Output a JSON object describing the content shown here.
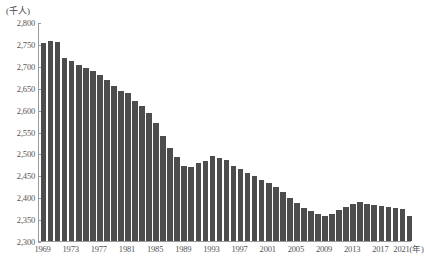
{
  "chart_data": {
    "type": "bar",
    "title": "",
    "subtitle": "",
    "xlabel": "年",
    "ylabel": "千人",
    "unit_label": "(千人)",
    "x_axis_end_label": "2021(年)",
    "ylim": [
      2300,
      2800
    ],
    "ytick_step": 50,
    "ytick_labels": [
      "2,800",
      "2,750",
      "2,700",
      "2,650",
      "2,600",
      "2,550",
      "2,500",
      "2,450",
      "2,400",
      "2,350",
      "2,300"
    ],
    "ytick_values": [
      2800,
      2750,
      2700,
      2650,
      2600,
      2550,
      2500,
      2450,
      2400,
      2350,
      2300
    ],
    "xtick_labels": [
      "1969",
      "1973",
      "1977",
      "1981",
      "1985",
      "1989",
      "1993",
      "1997",
      "2001",
      "2005",
      "2009",
      "2013",
      "2017",
      "2021(年)"
    ],
    "xtick_years": [
      1969,
      1973,
      1977,
      1981,
      1985,
      1989,
      1993,
      1997,
      2001,
      2005,
      2009,
      2013,
      2017,
      2021
    ],
    "grid": false,
    "legend": false,
    "bar_color": "#4d4d4d",
    "axis_color": "#9a9a9a",
    "text_color": "#555555",
    "categories": [
      1969,
      1970,
      1971,
      1972,
      1973,
      1974,
      1975,
      1976,
      1977,
      1978,
      1979,
      1980,
      1981,
      1982,
      1983,
      1984,
      1985,
      1986,
      1987,
      1988,
      1989,
      1990,
      1991,
      1992,
      1993,
      1994,
      1995,
      1996,
      1997,
      1998,
      1999,
      2000,
      2001,
      2002,
      2003,
      2004,
      2005,
      2006,
      2007,
      2008,
      2009,
      2010,
      2011,
      2012,
      2013,
      2014,
      2015,
      2016,
      2017,
      2018,
      2019,
      2020,
      2021
    ],
    "values": [
      2752,
      2757,
      2755,
      2718,
      2712,
      2702,
      2695,
      2688,
      2680,
      2667,
      2655,
      2643,
      2638,
      2620,
      2608,
      2592,
      2570,
      2540,
      2512,
      2492,
      2472,
      2470,
      2478,
      2482,
      2494,
      2490,
      2486,
      2472,
      2464,
      2455,
      2448,
      2440,
      2432,
      2424,
      2412,
      2398,
      2386,
      2376,
      2368,
      2362,
      2358,
      2362,
      2370,
      2378,
      2384,
      2388,
      2385,
      2382,
      2380,
      2378,
      2376,
      2374,
      2356
    ]
  }
}
